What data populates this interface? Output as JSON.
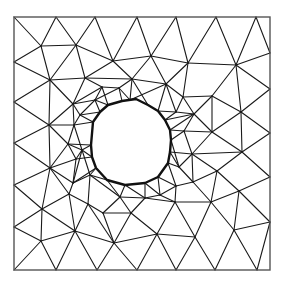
{
  "diagram": {
    "type": "triangular-mesh",
    "colors": {
      "edge": "#1a1a1a",
      "border": "#555555",
      "hole": "#111111",
      "background": "#ffffff"
    },
    "domain": {
      "x0": 14,
      "y0": 17,
      "x1": 270,
      "y1": 270
    },
    "hole_polygon": [
      [
        108,
        105
      ],
      [
        122,
        101
      ],
      [
        136,
        99
      ],
      [
        148,
        105
      ],
      [
        158,
        111
      ],
      [
        165,
        120
      ],
      [
        170,
        130
      ],
      [
        171,
        140
      ],
      [
        170,
        152
      ],
      [
        168,
        163
      ],
      [
        158,
        177
      ],
      [
        145,
        183
      ],
      [
        125,
        185
      ],
      [
        107,
        180
      ],
      [
        96,
        168
      ],
      [
        92,
        157
      ],
      [
        91,
        145
      ],
      [
        93,
        122
      ],
      [
        100,
        112
      ]
    ],
    "vertices": {
      "A1": [
        14,
        17
      ],
      "A2": [
        56,
        17
      ],
      "A3": [
        95,
        17
      ],
      "A4": [
        137,
        17
      ],
      "A5": [
        176,
        17
      ],
      "A6": [
        216,
        17
      ],
      "A7": [
        256,
        17
      ],
      "A8": [
        270,
        17
      ],
      "L1": [
        14,
        62
      ],
      "L2": [
        14,
        102
      ],
      "L3": [
        14,
        143
      ],
      "L4": [
        14,
        185
      ],
      "L5": [
        14,
        227
      ],
      "L6": [
        14,
        270
      ],
      "R1": [
        270,
        53
      ],
      "R2": [
        270,
        89
      ],
      "R3": [
        270,
        133
      ],
      "R4": [
        270,
        177
      ],
      "R5": [
        270,
        222
      ],
      "R6": [
        270,
        270
      ],
      "B1": [
        56,
        270
      ],
      "B2": [
        97,
        270
      ],
      "B3": [
        137,
        270
      ],
      "B4": [
        176,
        270
      ],
      "B5": [
        215,
        270
      ],
      "B6": [
        257,
        270
      ],
      "P1": [
        41,
        46
      ],
      "P2": [
        76,
        45
      ],
      "P3": [
        113,
        61
      ],
      "P4": [
        151,
        56
      ],
      "P5": [
        188,
        63
      ],
      "P6": [
        236,
        65
      ],
      "P7": [
        50,
        80
      ],
      "P8": [
        85,
        78
      ],
      "P9": [
        132,
        79
      ],
      "P10": [
        166,
        84
      ],
      "P11": [
        49,
        125
      ],
      "P12": [
        73,
        104
      ],
      "P13": [
        102,
        87
      ],
      "P14": [
        119,
        88
      ],
      "P15": [
        95,
        100
      ],
      "P16": [
        130,
        100
      ],
      "P17": [
        183,
        97
      ],
      "P18": [
        212,
        96
      ],
      "P19": [
        241,
        112
      ],
      "P20": [
        194,
        114
      ],
      "P21": [
        74,
        125
      ],
      "P22": [
        68,
        144
      ],
      "P23": [
        76,
        159
      ],
      "P24": [
        50,
        168
      ],
      "P25": [
        73,
        183
      ],
      "P26": [
        184,
        131
      ],
      "P27": [
        212,
        132
      ],
      "P28": [
        192,
        154
      ],
      "P29": [
        242,
        152
      ],
      "P30": [
        217,
        171
      ],
      "P31": [
        179,
        167
      ],
      "P32": [
        193,
        182
      ],
      "P33": [
        239,
        191
      ],
      "P34": [
        211,
        202
      ],
      "P35": [
        42,
        209
      ],
      "P36": [
        69,
        194
      ],
      "P37": [
        75,
        231
      ],
      "P38": [
        41,
        241
      ],
      "P39": [
        114,
        243
      ],
      "P40": [
        90,
        175
      ],
      "P41": [
        88,
        204
      ],
      "P42": [
        103,
        213
      ],
      "P43": [
        131,
        213
      ],
      "P44": [
        145,
        198
      ],
      "P45": [
        175,
        202
      ],
      "P46": [
        157,
        234
      ],
      "P47": [
        195,
        237
      ],
      "P48": [
        234,
        230
      ],
      "P49": [
        120,
        197
      ],
      "P50": [
        160,
        195
      ],
      "P51": [
        80,
        115
      ],
      "P52": [
        176,
        112
      ],
      "P53": [
        82,
        150
      ],
      "P54": [
        176,
        186
      ]
    },
    "edges": [
      [
        "A1",
        "P1"
      ],
      [
        "A2",
        "P1"
      ],
      [
        "A2",
        "P2"
      ],
      [
        "A3",
        "P2"
      ],
      [
        "A3",
        "P3"
      ],
      [
        "A4",
        "P3"
      ],
      [
        "A4",
        "P4"
      ],
      [
        "A5",
        "P4"
      ],
      [
        "A5",
        "P5"
      ],
      [
        "A6",
        "P5"
      ],
      [
        "A6",
        "P6"
      ],
      [
        "A7",
        "P6"
      ],
      [
        "A7",
        "R1"
      ],
      [
        "L1",
        "P1"
      ],
      [
        "L1",
        "P7"
      ],
      [
        "L2",
        "P7"
      ],
      [
        "L2",
        "P11"
      ],
      [
        "L3",
        "P11"
      ],
      [
        "L3",
        "P24"
      ],
      [
        "L4",
        "P24"
      ],
      [
        "L4",
        "P35"
      ],
      [
        "L5",
        "P35"
      ],
      [
        "L5",
        "P38"
      ],
      [
        "L6",
        "P38"
      ],
      [
        "B1",
        "P38"
      ],
      [
        "B1",
        "P37"
      ],
      [
        "B2",
        "P37"
      ],
      [
        "B2",
        "P39"
      ],
      [
        "B3",
        "P39"
      ],
      [
        "B3",
        "P46"
      ],
      [
        "B4",
        "P46"
      ],
      [
        "B4",
        "P47"
      ],
      [
        "B5",
        "P47"
      ],
      [
        "B5",
        "P48"
      ],
      [
        "B6",
        "P48"
      ],
      [
        "B6",
        "R5"
      ],
      [
        "R1",
        "P6"
      ],
      [
        "R2",
        "P6"
      ],
      [
        "R2",
        "P19"
      ],
      [
        "R3",
        "P19"
      ],
      [
        "R3",
        "P29"
      ],
      [
        "R4",
        "P29"
      ],
      [
        "R4",
        "P33"
      ],
      [
        "R5",
        "P33"
      ],
      [
        "R5",
        "P48"
      ],
      [
        "P1",
        "P2"
      ],
      [
        "P1",
        "P7"
      ],
      [
        "P2",
        "P7"
      ],
      [
        "P2",
        "P8"
      ],
      [
        "P2",
        "P3"
      ],
      [
        "P3",
        "P8"
      ],
      [
        "P3",
        "P9"
      ],
      [
        "P3",
        "P4"
      ],
      [
        "P4",
        "P9"
      ],
      [
        "P4",
        "P10"
      ],
      [
        "P4",
        "P5"
      ],
      [
        "P5",
        "P10"
      ],
      [
        "P5",
        "P6"
      ],
      [
        "P5",
        "P17"
      ],
      [
        "P6",
        "P18"
      ],
      [
        "P6",
        "P19"
      ],
      [
        "P7",
        "P8"
      ],
      [
        "P7",
        "P11"
      ],
      [
        "P7",
        "P12"
      ],
      [
        "P8",
        "P12"
      ],
      [
        "P8",
        "P13"
      ],
      [
        "P8",
        "P9"
      ],
      [
        "P9",
        "P14"
      ],
      [
        "P9",
        "P10"
      ],
      [
        "P9",
        "P16"
      ],
      [
        "P10",
        "P16"
      ],
      [
        "P10",
        "P17"
      ],
      [
        "P10",
        "P52"
      ],
      [
        "P11",
        "P12"
      ],
      [
        "P11",
        "P21"
      ],
      [
        "P11",
        "P22"
      ],
      [
        "P11",
        "P24"
      ],
      [
        "P12",
        "P15"
      ],
      [
        "P12",
        "P21"
      ],
      [
        "P12",
        "P13"
      ],
      [
        "P13",
        "P14"
      ],
      [
        "P13",
        "P15"
      ],
      [
        "P14",
        "P16"
      ],
      [
        "P14",
        "P15"
      ],
      [
        "P17",
        "P18"
      ],
      [
        "P17",
        "P52"
      ],
      [
        "P17",
        "P20"
      ],
      [
        "P18",
        "P19"
      ],
      [
        "P18",
        "P20"
      ],
      [
        "P18",
        "P27"
      ],
      [
        "P19",
        "P27"
      ],
      [
        "P19",
        "P29"
      ],
      [
        "P20",
        "P26"
      ],
      [
        "P20",
        "P52"
      ],
      [
        "P20",
        "P27"
      ],
      [
        "P21",
        "P22"
      ],
      [
        "P21",
        "P51"
      ],
      [
        "P22",
        "P23"
      ],
      [
        "P22",
        "P24"
      ],
      [
        "P22",
        "P53"
      ],
      [
        "P23",
        "P24"
      ],
      [
        "P23",
        "P25"
      ],
      [
        "P23",
        "P53"
      ],
      [
        "P24",
        "P25"
      ],
      [
        "P24",
        "P36"
      ],
      [
        "P24",
        "P35"
      ],
      [
        "P26",
        "P27"
      ],
      [
        "P26",
        "P28"
      ],
      [
        "P27",
        "P28"
      ],
      [
        "P27",
        "P29"
      ],
      [
        "P28",
        "P29"
      ],
      [
        "P28",
        "P30"
      ],
      [
        "P28",
        "P31"
      ],
      [
        "P29",
        "P30"
      ],
      [
        "P30",
        "P33"
      ],
      [
        "P30",
        "P32"
      ],
      [
        "P31",
        "P32"
      ],
      [
        "P28",
        "P32"
      ],
      [
        "P32",
        "P34"
      ],
      [
        "P32",
        "P54"
      ],
      [
        "P30",
        "P34"
      ],
      [
        "P33",
        "P34"
      ],
      [
        "P33",
        "P48"
      ],
      [
        "P34",
        "P48"
      ],
      [
        "P34",
        "P47"
      ],
      [
        "P34",
        "P45"
      ],
      [
        "P25",
        "P36"
      ],
      [
        "P25",
        "P40"
      ],
      [
        "P36",
        "P35"
      ],
      [
        "P36",
        "P41"
      ],
      [
        "P36",
        "P37"
      ],
      [
        "P35",
        "P37"
      ],
      [
        "P35",
        "P38"
      ],
      [
        "P37",
        "P38"
      ],
      [
        "P37",
        "P41"
      ],
      [
        "P37",
        "P39"
      ],
      [
        "P40",
        "P41"
      ],
      [
        "P40",
        "P49"
      ],
      [
        "P41",
        "P42"
      ],
      [
        "P42",
        "P49"
      ],
      [
        "P42",
        "P43"
      ],
      [
        "P42",
        "P39"
      ],
      [
        "P41",
        "P39"
      ],
      [
        "P43",
        "P39"
      ],
      [
        "P43",
        "P49"
      ],
      [
        "P43",
        "P44"
      ],
      [
        "P43",
        "P46"
      ],
      [
        "P39",
        "P46"
      ],
      [
        "P44",
        "P49"
      ],
      [
        "P44",
        "P50"
      ],
      [
        "P44",
        "P45"
      ],
      [
        "P45",
        "P50"
      ],
      [
        "P45",
        "P46"
      ],
      [
        "P45",
        "P47"
      ],
      [
        "P46",
        "P47"
      ],
      [
        "P45",
        "P54"
      ],
      [
        "P50",
        "P54"
      ],
      [
        "P51",
        "P12"
      ],
      [
        "P51",
        "P15"
      ],
      [
        "P53",
        "P25"
      ],
      [
        "P53",
        "P40"
      ],
      [
        "P21",
        "P53"
      ]
    ],
    "hole_edges": [
      [
        "P15",
        "H0"
      ],
      [
        "P13",
        "H0"
      ],
      [
        "P14",
        "H1"
      ],
      [
        "P16",
        "H1"
      ],
      [
        "P16",
        "H2"
      ],
      [
        "P16",
        "H3"
      ],
      [
        "P9",
        "H3"
      ],
      [
        "P10",
        "H4"
      ],
      [
        "P52",
        "H4"
      ],
      [
        "P52",
        "H5"
      ],
      [
        "P20",
        "H5"
      ],
      [
        "P26",
        "H6"
      ],
      [
        "P20",
        "H6"
      ],
      [
        "P26",
        "H7"
      ],
      [
        "P31",
        "H7"
      ],
      [
        "P28",
        "H8"
      ],
      [
        "P31",
        "H8"
      ],
      [
        "P31",
        "H9"
      ],
      [
        "P54",
        "H9"
      ],
      [
        "P54",
        "H10"
      ],
      [
        "P50",
        "H10"
      ],
      [
        "P50",
        "H11"
      ],
      [
        "P44",
        "H11"
      ],
      [
        "P49",
        "H12"
      ],
      [
        "P44",
        "H12"
      ],
      [
        "P49",
        "H13"
      ],
      [
        "P40",
        "H13"
      ],
      [
        "P40",
        "H14"
      ],
      [
        "P25",
        "H14"
      ],
      [
        "P53",
        "H15"
      ],
      [
        "P23",
        "H15"
      ],
      [
        "P53",
        "H16"
      ],
      [
        "P22",
        "H16"
      ],
      [
        "P21",
        "H17"
      ],
      [
        "P51",
        "H17"
      ],
      [
        "P51",
        "H18"
      ],
      [
        "P15",
        "H18"
      ]
    ]
  }
}
